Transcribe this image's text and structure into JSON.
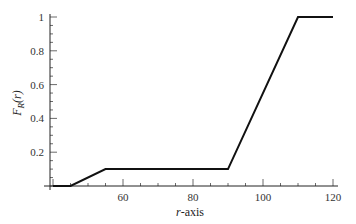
{
  "chart_data": {
    "type": "line",
    "title": "",
    "xlabel": "r-axis",
    "ylabel": "F_R(r)",
    "xlim": [
      39,
      121
    ],
    "ylim": [
      0,
      1.0
    ],
    "grid": false,
    "legend": null,
    "x_ticks": [
      60,
      80,
      100,
      120
    ],
    "x_tick_labels": [
      "60",
      "80",
      "100",
      "120"
    ],
    "y_ticks": [
      0.2,
      0.4,
      0.6,
      0.8,
      1
    ],
    "y_tick_labels": [
      "0.2",
      "0.4",
      "0.6",
      "0.8",
      "1"
    ],
    "series": [
      {
        "name": "F_R(r)",
        "x": [
          40,
          45,
          55,
          90,
          110,
          120
        ],
        "y": [
          0,
          0,
          0.1,
          0.1,
          1,
          1
        ],
        "color": "#111111"
      }
    ]
  },
  "labels": {
    "xlabel_italic": "r",
    "xlabel_rest": "-axis",
    "ylabel_main": "F",
    "ylabel_sub": "R",
    "ylabel_arg": "(r)"
  }
}
